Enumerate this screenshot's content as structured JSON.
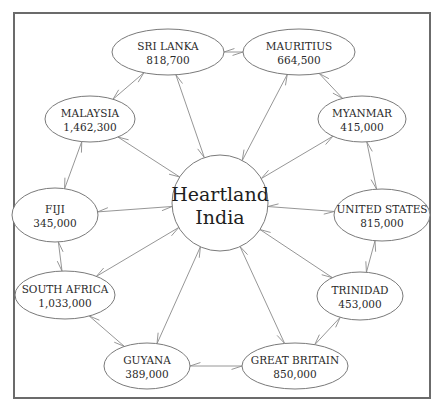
{
  "diagram": {
    "title": "Heartland India",
    "center": {
      "line1": "Heartland",
      "line2": "India",
      "cx": 220,
      "cy": 203,
      "r": 48
    },
    "nodes": [
      {
        "id": "sri-lanka",
        "name": "SRI LANKA",
        "population": "818,700",
        "cx": 168,
        "cy": 52,
        "rx": 56,
        "ry": 23
      },
      {
        "id": "mauritius",
        "name": "MAURITIUS",
        "population": "664,500",
        "cx": 299,
        "cy": 52,
        "rx": 56,
        "ry": 23
      },
      {
        "id": "malaysia",
        "name": "MALAYSIA",
        "population": "1,462,300",
        "cx": 90,
        "cy": 119,
        "rx": 45,
        "ry": 23
      },
      {
        "id": "myanmar",
        "name": "MYANMAR",
        "population": "415,000",
        "cx": 362,
        "cy": 119,
        "rx": 44,
        "ry": 23
      },
      {
        "id": "fiji",
        "name": "FIJI",
        "population": "345,000",
        "cx": 55,
        "cy": 215,
        "rx": 43,
        "ry": 27
      },
      {
        "id": "united-states",
        "name": "UNITED STATES",
        "population": "815,000",
        "cx": 382,
        "cy": 215,
        "rx": 48,
        "ry": 26
      },
      {
        "id": "south-africa",
        "name": "SOUTH AFRICA",
        "population": "1,033,000",
        "cx": 65,
        "cy": 295,
        "rx": 50,
        "ry": 24
      },
      {
        "id": "trinidad",
        "name": "TRINIDAD",
        "population": "453,000",
        "cx": 360,
        "cy": 296,
        "rx": 43,
        "ry": 24
      },
      {
        "id": "guyana",
        "name": "GUYANA",
        "population": "389,000",
        "cx": 147,
        "cy": 366,
        "rx": 43,
        "ry": 23
      },
      {
        "id": "great-britain",
        "name": "GREAT BRITAIN",
        "population": "850,000",
        "cx": 295,
        "cy": 366,
        "rx": 53,
        "ry": 23
      }
    ],
    "edges": [
      {
        "from": "sri-lanka",
        "to": "mauritius",
        "type": "ring"
      },
      {
        "from": "mauritius",
        "to": "myanmar",
        "type": "ring"
      },
      {
        "from": "myanmar",
        "to": "united-states",
        "type": "ring"
      },
      {
        "from": "united-states",
        "to": "trinidad",
        "type": "ring"
      },
      {
        "from": "trinidad",
        "to": "great-britain",
        "type": "ring"
      },
      {
        "from": "great-britain",
        "to": "guyana",
        "type": "ring"
      },
      {
        "from": "guyana",
        "to": "south-africa",
        "type": "ring"
      },
      {
        "from": "south-africa",
        "to": "fiji",
        "type": "ring"
      },
      {
        "from": "fiji",
        "to": "malaysia",
        "type": "ring"
      },
      {
        "from": "malaysia",
        "to": "sri-lanka",
        "type": "ring"
      },
      {
        "from": "center",
        "to": "sri-lanka",
        "type": "spoke"
      },
      {
        "from": "center",
        "to": "mauritius",
        "type": "spoke"
      },
      {
        "from": "center",
        "to": "malaysia",
        "type": "spoke"
      },
      {
        "from": "center",
        "to": "myanmar",
        "type": "spoke"
      },
      {
        "from": "center",
        "to": "fiji",
        "type": "spoke"
      },
      {
        "from": "center",
        "to": "united-states",
        "type": "spoke"
      },
      {
        "from": "center",
        "to": "south-africa",
        "type": "spoke"
      },
      {
        "from": "center",
        "to": "trinidad",
        "type": "spoke"
      },
      {
        "from": "center",
        "to": "guyana",
        "type": "spoke"
      },
      {
        "from": "center",
        "to": "great-britain",
        "type": "spoke"
      }
    ],
    "colors": {
      "frame": "#6b6b6b",
      "node_stroke": "#7a7a7a",
      "edge": "#8a8a8a",
      "text": "#2a2a2a"
    }
  }
}
